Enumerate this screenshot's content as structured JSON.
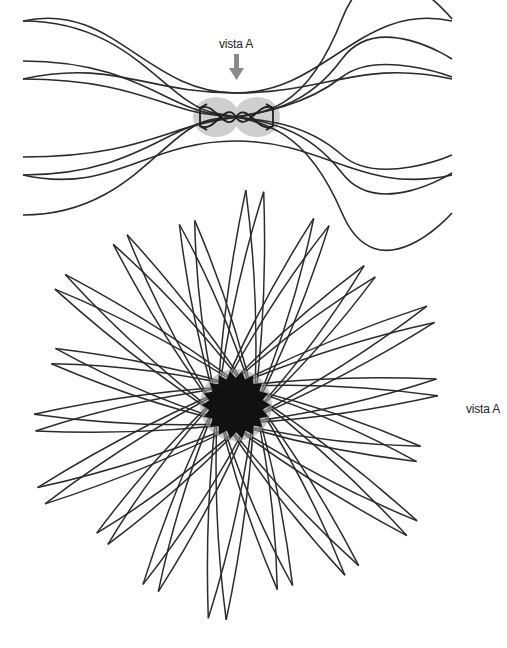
{
  "figure": {
    "labels": {
      "top_view_label": "vista A",
      "side_view_label": "vista A"
    },
    "arrow": {
      "direction": "down",
      "color": "#8a8a8a"
    },
    "colors": {
      "stroke": "#2b2b2b",
      "core_fill": "#c8c8c8",
      "dense_core": "#111111",
      "background": "#ffffff"
    },
    "top_view": {
      "center": [
        236,
        117
      ],
      "left_x": 23,
      "right_x": 452,
      "strand_endpoints_y": [
        21,
        61,
        79,
        157,
        175,
        215
      ],
      "core_ellipses": [
        {
          "cx": 215,
          "cy": 117,
          "rx": 22,
          "ry": 20
        },
        {
          "cx": 257,
          "cy": 117,
          "rx": 22,
          "ry": 20
        }
      ]
    },
    "radial_view": {
      "center": [
        236,
        405
      ],
      "outer_radius": 215,
      "strand_count": 36,
      "core_radius": 30
    }
  }
}
